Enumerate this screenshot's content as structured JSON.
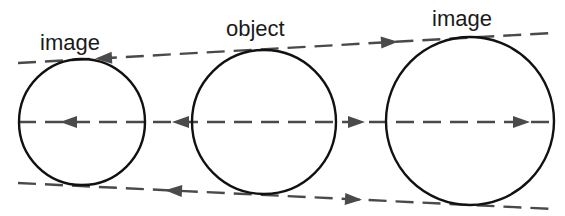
{
  "diagram": {
    "type": "optical ray diagram",
    "labels": {
      "left": "image",
      "center": "object",
      "right": "image"
    },
    "circles": [
      {
        "role": "image-left",
        "cx": 82,
        "cy": 122,
        "r": 63
      },
      {
        "role": "object",
        "cx": 263,
        "cy": 122,
        "r": 72
      },
      {
        "role": "image-right",
        "cx": 470,
        "cy": 121,
        "r": 84
      }
    ],
    "lines": [
      {
        "role": "top-tangent",
        "x1": 18,
        "y1": 63,
        "x2": 552,
        "y2": 33
      },
      {
        "role": "center-axis",
        "x1": 18,
        "y1": 122,
        "x2": 553,
        "y2": 122
      },
      {
        "role": "bottom-tangent",
        "x1": 18,
        "y1": 183,
        "x2": 553,
        "y2": 209
      }
    ],
    "arrows": [
      {
        "line": "top-tangent",
        "x": 95,
        "direction": "left"
      },
      {
        "line": "top-tangent",
        "x": 398,
        "direction": "right"
      },
      {
        "line": "center-axis",
        "x": 60,
        "direction": "left"
      },
      {
        "line": "center-axis",
        "x": 172,
        "direction": "left"
      },
      {
        "line": "center-axis",
        "x": 365,
        "direction": "right"
      },
      {
        "line": "center-axis",
        "x": 530,
        "direction": "right"
      },
      {
        "line": "bottom-tangent",
        "x": 165,
        "direction": "left"
      },
      {
        "line": "bottom-tangent",
        "x": 362,
        "direction": "right"
      }
    ],
    "colors": {
      "circle_stroke": "#111111",
      "dashed_line": "#4a4a4a",
      "background": "#ffffff"
    }
  }
}
